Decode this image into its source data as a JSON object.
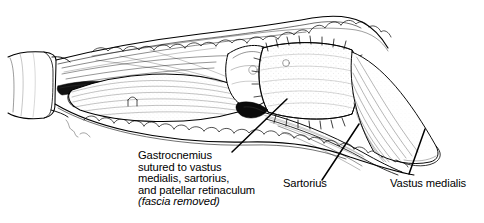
{
  "figure": {
    "type": "medical-line-illustration",
    "background_color": "#ffffff",
    "ink_color": "#000000",
    "width": 484,
    "height": 223
  },
  "annotations": {
    "gastrocnemius": {
      "name": "gastrocnemius-caption",
      "lines": [
        "Gastrocnemius",
        "sutured to vastus",
        "medialis, sartorius,",
        "and patellar retinaculum"
      ],
      "italic_line": "(fascia removed)",
      "leader": {
        "x1": 232,
        "y1": 152,
        "x2": 287,
        "y2": 99
      }
    },
    "sartorius": {
      "name": "sartorius-label",
      "text": "Sartorius",
      "leader": {
        "x1": 322,
        "y1": 180,
        "x2": 359,
        "y2": 124
      }
    },
    "vastus_medialis": {
      "name": "vastus-medialis-label",
      "text": "Vastus medialis",
      "leader": {
        "x1": 409,
        "y1": 174,
        "x2": 425,
        "y2": 129
      }
    }
  },
  "structures": [
    {
      "name": "thigh-cuff",
      "description": "proximal limb / drape cuff at left"
    },
    {
      "name": "skin-edge-upper",
      "description": "retracted upper skin and subcutaneous fat margin"
    },
    {
      "name": "skin-edge-lower",
      "description": "retracted lower skin and subcutaneous fat margin"
    },
    {
      "name": "gastrocnemius-flap",
      "description": "elongated muscle belly rotated into the defect"
    },
    {
      "name": "patella-condyle",
      "description": "rounded bony prominence with stippled shading"
    },
    {
      "name": "suture-line-superior",
      "description": "interrupted stitches along superior flap margin"
    },
    {
      "name": "suture-line-inferior",
      "description": "interrupted stitches along inferior flap margin"
    },
    {
      "name": "suture-line-lateral",
      "description": "interrupted stitches along lateral flap margin"
    },
    {
      "name": "pedicle-shadow",
      "description": "dark wedge at flap pedicle"
    },
    {
      "name": "wound-depth-shadow",
      "description": "dark wedge inside proximal wound"
    },
    {
      "name": "vastus-medialis-muscle",
      "description": "striated muscle at right"
    },
    {
      "name": "sartorius-muscle",
      "description": "strap muscle below flap"
    }
  ]
}
